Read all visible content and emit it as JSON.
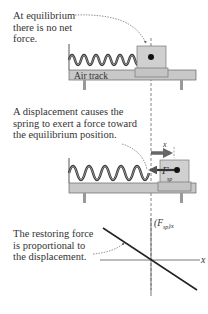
{
  "panel1": {
    "caption_lines": [
      "At equilibrium",
      "there is no net",
      "force."
    ],
    "track_label": "Air track"
  },
  "panel2": {
    "caption_lines": [
      "A displacement causes the",
      "spring to exert a force toward",
      "the equilibrium position."
    ],
    "displacement_label": "x",
    "force_label": "F",
    "force_subscript": "sp"
  },
  "panel3": {
    "caption_lines": [
      "The restoring force",
      "is proportional to",
      "the displacement."
    ],
    "y_axis_label": "(F",
    "y_axis_sub": "sp",
    "y_axis_sub2": ")x",
    "x_axis_label": "x"
  },
  "colors": {
    "track": "#c8c8c8",
    "block": "#d0d0d0",
    "spring": "#333333",
    "arrow": "#555555",
    "text": "#333333"
  }
}
